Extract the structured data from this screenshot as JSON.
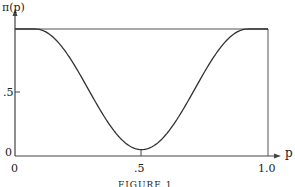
{
  "chart_data": {
    "type": "line",
    "title": "",
    "caption": "FIGURE 1",
    "xlabel": "p",
    "ylabel": "π(p)",
    "xlim": [
      0,
      1.0
    ],
    "ylim": [
      0,
      1.0
    ],
    "x_ticks": [
      "0",
      ".5",
      "1.0"
    ],
    "y_ticks": [
      "0",
      ".5"
    ],
    "grid": false,
    "frame": "box from p=0 to p=1.0 at height 1",
    "series": [
      {
        "name": "π(p)",
        "x": [
          0.0,
          0.05,
          0.08,
          0.15,
          0.2,
          0.25,
          0.3,
          0.35,
          0.4,
          0.45,
          0.5,
          0.55,
          0.6,
          0.65,
          0.7,
          0.75,
          0.8,
          0.85,
          0.92,
          0.95,
          1.0
        ],
        "values": [
          1.0,
          1.0,
          1.0,
          0.93,
          0.83,
          0.69,
          0.52,
          0.36,
          0.2,
          0.09,
          0.05,
          0.09,
          0.2,
          0.36,
          0.52,
          0.69,
          0.83,
          0.93,
          1.0,
          1.0,
          1.0
        ]
      }
    ]
  },
  "labels": {
    "ylabel": "π(p)",
    "xlabel": "p",
    "y0": "0",
    "y5": ".5",
    "x0": "0",
    "x5": ".5",
    "x10": "1.0",
    "caption": "FIGURE 1"
  }
}
